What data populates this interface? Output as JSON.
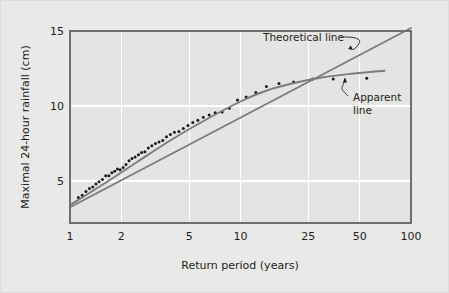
{
  "figure": {
    "background_color": "#e9e9e7",
    "plot_background_color": "#e4e4e2",
    "grid_color": "#ffffff",
    "axis_color": "#6f6f6f",
    "line_color": "#7b7b7b",
    "point_color": "#1a1a1a",
    "text_color": "#231f20"
  },
  "chart_data": {
    "type": "scatter",
    "title": "",
    "subtitle": "",
    "xlabel": "Return period (years)",
    "ylabel": "Maximal 24-hour rainfall (cm)",
    "xscale": "log",
    "yscale": "linear",
    "xlim": [
      1,
      100
    ],
    "ylim": [
      2.2,
      15
    ],
    "grid": true,
    "legend": "none",
    "xticks": [
      1,
      2,
      5,
      10,
      25,
      50,
      100
    ],
    "xtick_labels": [
      "1",
      "2",
      "5",
      "10",
      "25",
      "50",
      "100"
    ],
    "yticks": [
      5,
      10,
      15
    ],
    "ytick_labels": [
      "5",
      "10",
      "15"
    ],
    "series": [
      {
        "name": "Observed maxima",
        "type": "scatter",
        "marker": "dot",
        "color": "#1a1a1a",
        "x": [
          1.12,
          1.18,
          1.24,
          1.3,
          1.36,
          1.42,
          1.48,
          1.55,
          1.62,
          1.69,
          1.76,
          1.83,
          1.9,
          1.97,
          2.05,
          2.13,
          2.22,
          2.31,
          2.41,
          2.52,
          2.63,
          2.75,
          2.88,
          3.02,
          3.17,
          3.33,
          3.5,
          3.68,
          3.88,
          4.1,
          4.35,
          4.62,
          4.92,
          5.25,
          5.62,
          6.05,
          6.55,
          7.1,
          7.8,
          8.6,
          9.6,
          10.8,
          12.3,
          14.2,
          16.8,
          20.5,
          26.5,
          35.0,
          55.0
        ],
        "y": [
          3.9,
          4.05,
          4.3,
          4.5,
          4.6,
          4.8,
          4.95,
          5.1,
          5.35,
          5.35,
          5.55,
          5.65,
          5.8,
          5.75,
          5.9,
          6.1,
          6.35,
          6.5,
          6.6,
          6.75,
          6.9,
          6.95,
          7.2,
          7.35,
          7.5,
          7.6,
          7.7,
          7.95,
          8.1,
          8.25,
          8.3,
          8.5,
          8.7,
          8.9,
          9.05,
          9.25,
          9.4,
          9.55,
          9.6,
          9.85,
          10.4,
          10.6,
          10.9,
          11.3,
          11.5,
          11.6,
          11.8,
          11.8,
          11.85
        ]
      },
      {
        "name": "Theoretical line",
        "type": "line",
        "color": "#7b7b7b",
        "x": [
          1.0,
          100.0
        ],
        "y": [
          3.25,
          15.2
        ]
      },
      {
        "name": "Apparent line",
        "type": "line",
        "color": "#7b7b7b",
        "x": [
          1.0,
          1.6,
          2.5,
          4.0,
          6.3,
          10.0,
          14.0,
          20.0,
          30.0,
          45.0,
          70.0
        ],
        "y": [
          3.4,
          4.85,
          6.3,
          7.8,
          9.1,
          10.3,
          11.0,
          11.5,
          11.9,
          12.15,
          12.35
        ]
      }
    ],
    "annotations": [
      {
        "id": "theoretical-line-annotation",
        "text": "Theoretical line",
        "text_lines": [
          "Theoretical line"
        ],
        "label_x": 262,
        "label_y": 40,
        "target_x": 352,
        "target_y": 49
      },
      {
        "id": "apparent-line-annotation",
        "text": "Apparent line",
        "text_lines": [
          "Apparent",
          "line"
        ],
        "label_x": 352,
        "label_y": 100,
        "target_x": 344,
        "target_y": 77
      }
    ]
  }
}
